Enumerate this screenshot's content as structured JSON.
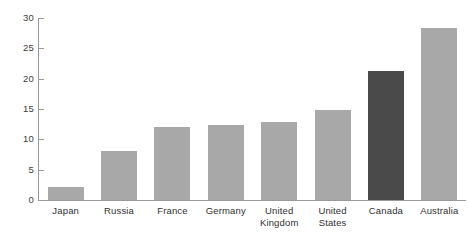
{
  "chart_data": {
    "type": "bar",
    "title": "",
    "subtitle": "",
    "xlabel": "",
    "ylabel": "",
    "categories": [
      "Japan",
      "Russia",
      "France",
      "Germany",
      "United Kingdom",
      "United States",
      "Canada",
      "Australia"
    ],
    "values": [
      2.2,
      8.0,
      12.0,
      12.3,
      12.8,
      14.8,
      21.3,
      28.4
    ],
    "ylim": [
      0,
      30
    ],
    "ytick_labels": [
      "0",
      "5",
      "10",
      "15",
      "20",
      "25",
      "30"
    ],
    "ytick_values": [
      0,
      5,
      10,
      15,
      20,
      25,
      30
    ],
    "grid": false,
    "legend": "none",
    "highlighted_category": "Canada",
    "colors": {
      "bar": "#a8a8a8",
      "bar_highlight": "#4a4a4a",
      "axis": "#9a9a9a",
      "tick_label": "#3b3b3b",
      "category_label": "#2f2f2f",
      "background": "#ffffff"
    },
    "bars": [
      {
        "category": "Japan",
        "label": "Japan",
        "value": 2.2,
        "highlighted": false
      },
      {
        "category": "Russia",
        "label": "Russia",
        "value": 8.0,
        "highlighted": false
      },
      {
        "category": "France",
        "label": "France",
        "value": 12.0,
        "highlighted": false
      },
      {
        "category": "Germany",
        "label": "Germany",
        "value": 12.3,
        "highlighted": false
      },
      {
        "category": "United Kingdom",
        "label": "United\nKingdom",
        "value": 12.8,
        "highlighted": false
      },
      {
        "category": "United States",
        "label": "United\nStates",
        "value": 14.8,
        "highlighted": false
      },
      {
        "category": "Canada",
        "label": "Canada",
        "value": 21.3,
        "highlighted": true
      },
      {
        "category": "Australia",
        "label": "Australia",
        "value": 28.4,
        "highlighted": false
      }
    ]
  }
}
